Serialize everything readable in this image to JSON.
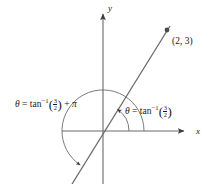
{
  "figure": {
    "type": "coordinate-diagram",
    "width": 211,
    "height": 184,
    "background_color": "#ffffff",
    "stroke_color": "#5a5a5a",
    "text_color": "#1a1a1a"
  },
  "axes": {
    "x_label": "x",
    "y_label": "y",
    "origin": {
      "x": 103,
      "y": 131
    },
    "x_axis": {
      "x_start": 62,
      "x_end": 188,
      "y": 131,
      "arrow": "right"
    },
    "y_axis": {
      "x": 103,
      "y_start": 8,
      "y_end": 184,
      "arrow": "up"
    }
  },
  "point": {
    "label": "(2, 3)",
    "coordinates": {
      "x": 2,
      "y": 3
    },
    "pixel": {
      "x": 167,
      "y": 30
    },
    "marker": "dot"
  },
  "line": {
    "description": "line through origin with slope 3/2",
    "slope": 1.5,
    "from_pixel": {
      "x": 72,
      "y": 184
    },
    "to_pixel": {
      "x": 170,
      "y": 26
    }
  },
  "arcs": [
    {
      "name": "inner-angle-arc",
      "radius": 26,
      "from_deg": 0,
      "to_deg": 56.3,
      "direction": "counterclockwise",
      "arrow": "end"
    },
    {
      "name": "outer-angle-arc",
      "radius": 41,
      "from_deg": 0,
      "to_deg": 236.3,
      "direction": "counterclockwise",
      "arrow": "end"
    }
  ],
  "labels": {
    "right": {
      "name": "theta-principal-label",
      "theta": "θ",
      "equals": "=",
      "function": "tan",
      "exponent": "−1",
      "numerator": "3",
      "denominator": "2",
      "plain_text": "θ = tan⁻¹(3/2)"
    },
    "left": {
      "name": "theta-plus-pi-label",
      "theta": "θ",
      "equals": "=",
      "function": "tan",
      "exponent": "−1",
      "numerator": "3",
      "denominator": "2",
      "plus": "+",
      "pi": "π",
      "plain_text": "θ = tan⁻¹(3/2) + π"
    }
  }
}
